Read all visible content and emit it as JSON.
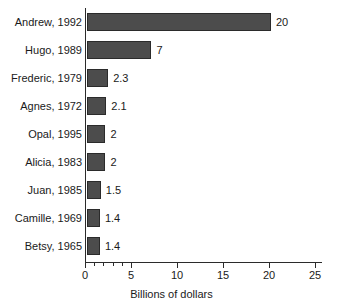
{
  "chart_data": {
    "type": "bar",
    "orientation": "horizontal",
    "title": "",
    "xlabel": "Billions of dollars",
    "ylabel": "",
    "categories": [
      "Andrew, 1992",
      "Hugo, 1989",
      "Frederic, 1979",
      "Agnes, 1972",
      "Opal, 1995",
      "Alicia, 1983",
      "Juan, 1985",
      "Camille, 1969",
      "Betsy, 1965"
    ],
    "values": [
      20,
      7,
      2.3,
      2.1,
      2,
      2,
      1.5,
      1.4,
      1.4
    ],
    "value_labels": [
      "20",
      "7",
      "2.3",
      "2.1",
      "2",
      "2",
      "1.5",
      "1.4",
      "1.4"
    ],
    "xlim": [
      0,
      25.7
    ],
    "xticks": [
      0,
      5,
      10,
      15,
      20,
      25
    ],
    "xtick_labels": [
      "0",
      "5",
      "10",
      "15",
      "20",
      "25"
    ],
    "minor_xticks": [
      1,
      2,
      3,
      4
    ],
    "grid": false,
    "legend": null,
    "bar_color": "#4c4c4c",
    "bar_edge_color": "#2b2b2b",
    "axis_color": "#2b2b2b",
    "background_color": "#ffffff"
  }
}
